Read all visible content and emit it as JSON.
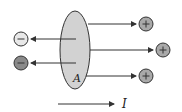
{
  "diagram": {
    "surface_label": "A",
    "current_label": "I",
    "negative_charges": [
      {
        "sign": "−",
        "fill": "#e8e8e8"
      },
      {
        "sign": "−",
        "fill": "#8a8a8a"
      }
    ],
    "positive_charges": [
      {
        "sign": "+",
        "fill": "#a9a9a9"
      },
      {
        "sign": "+",
        "fill": "#a9a9a9"
      },
      {
        "sign": "+",
        "fill": "#a9a9a9"
      }
    ],
    "colors": {
      "surface_fill": "#d2d2d2",
      "stroke": "#333333"
    }
  }
}
